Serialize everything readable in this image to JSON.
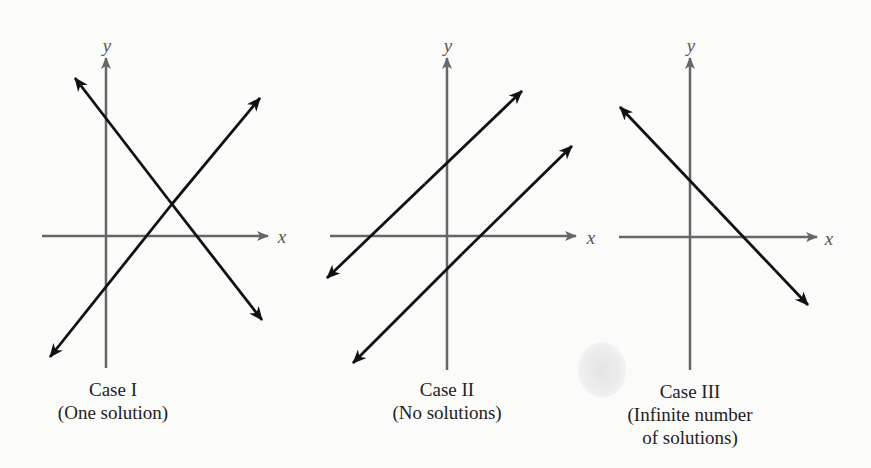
{
  "figure": {
    "panels": [
      {
        "id": "case-1",
        "case_label": "Case I",
        "description_lines": [
          "(One solution)"
        ],
        "x_label": "x",
        "y_label": "y",
        "lines": 2,
        "relationship": "intersecting"
      },
      {
        "id": "case-2",
        "case_label": "Case II",
        "description_lines": [
          "(No solutions)"
        ],
        "x_label": "x",
        "y_label": "y",
        "lines": 2,
        "relationship": "parallel"
      },
      {
        "id": "case-3",
        "case_label": "Case III",
        "description_lines": [
          "(Infinite number",
          "of solutions)"
        ],
        "x_label": "x",
        "y_label": "y",
        "lines": 1,
        "relationship": "coincident"
      }
    ],
    "colors": {
      "axis": "#666666",
      "line": "#111111",
      "text": "#222222",
      "background": "#fbfbfa"
    }
  }
}
